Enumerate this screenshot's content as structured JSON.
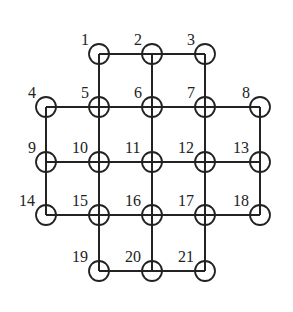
{
  "diagram": {
    "type": "grid-graph",
    "node_radius": 10,
    "colors": {
      "stroke": "#222222",
      "background": "#ffffff"
    },
    "nodes": [
      {
        "id": "1",
        "label": "1",
        "x": 99,
        "y": 54,
        "crossed": false
      },
      {
        "id": "2",
        "label": "2",
        "x": 152,
        "y": 54,
        "crossed": false
      },
      {
        "id": "3",
        "label": "3",
        "x": 205,
        "y": 54,
        "crossed": false
      },
      {
        "id": "4",
        "label": "4",
        "x": 46,
        "y": 107,
        "crossed": false
      },
      {
        "id": "5",
        "label": "5",
        "x": 99,
        "y": 107,
        "crossed": true
      },
      {
        "id": "6",
        "label": "6",
        "x": 152,
        "y": 107,
        "crossed": true
      },
      {
        "id": "7",
        "label": "7",
        "x": 205,
        "y": 107,
        "crossed": true
      },
      {
        "id": "8",
        "label": "8",
        "x": 260,
        "y": 107,
        "crossed": false
      },
      {
        "id": "9",
        "label": "9",
        "x": 46,
        "y": 162,
        "crossed": false
      },
      {
        "id": "10",
        "label": "10",
        "x": 99,
        "y": 162,
        "crossed": true
      },
      {
        "id": "11",
        "label": "11",
        "x": 152,
        "y": 162,
        "crossed": true
      },
      {
        "id": "12",
        "label": "12",
        "x": 205,
        "y": 162,
        "crossed": true
      },
      {
        "id": "13",
        "label": "13",
        "x": 260,
        "y": 162,
        "crossed": false
      },
      {
        "id": "14",
        "label": "14",
        "x": 46,
        "y": 215,
        "crossed": false
      },
      {
        "id": "15",
        "label": "15",
        "x": 99,
        "y": 215,
        "crossed": true
      },
      {
        "id": "16",
        "label": "16",
        "x": 152,
        "y": 215,
        "crossed": true
      },
      {
        "id": "17",
        "label": "17",
        "x": 205,
        "y": 215,
        "crossed": true
      },
      {
        "id": "18",
        "label": "18",
        "x": 260,
        "y": 215,
        "crossed": false
      },
      {
        "id": "19",
        "label": "19",
        "x": 99,
        "y": 271,
        "crossed": false
      },
      {
        "id": "20",
        "label": "20",
        "x": 152,
        "y": 271,
        "crossed": false
      },
      {
        "id": "21",
        "label": "21",
        "x": 205,
        "y": 271,
        "crossed": false
      }
    ],
    "edges": [
      [
        "1",
        "2"
      ],
      [
        "2",
        "3"
      ],
      [
        "4",
        "5"
      ],
      [
        "5",
        "6"
      ],
      [
        "6",
        "7"
      ],
      [
        "7",
        "8"
      ],
      [
        "9",
        "10"
      ],
      [
        "10",
        "11"
      ],
      [
        "11",
        "12"
      ],
      [
        "12",
        "13"
      ],
      [
        "14",
        "15"
      ],
      [
        "15",
        "16"
      ],
      [
        "16",
        "17"
      ],
      [
        "17",
        "18"
      ],
      [
        "19",
        "20"
      ],
      [
        "20",
        "21"
      ],
      [
        "1",
        "5"
      ],
      [
        "5",
        "10"
      ],
      [
        "10",
        "15"
      ],
      [
        "15",
        "19"
      ],
      [
        "2",
        "6"
      ],
      [
        "6",
        "11"
      ],
      [
        "11",
        "16"
      ],
      [
        "16",
        "20"
      ],
      [
        "3",
        "7"
      ],
      [
        "7",
        "12"
      ],
      [
        "12",
        "17"
      ],
      [
        "17",
        "21"
      ],
      [
        "4",
        "9"
      ],
      [
        "9",
        "14"
      ],
      [
        "8",
        "13"
      ],
      [
        "13",
        "18"
      ]
    ]
  }
}
